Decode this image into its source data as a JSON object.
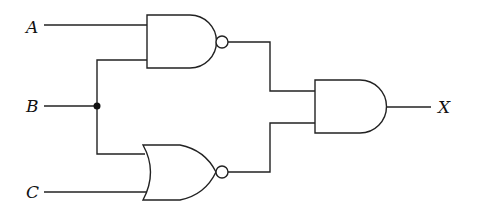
{
  "diagram": {
    "type": "logic-circuit",
    "inputs": [
      {
        "id": "A",
        "label": "A"
      },
      {
        "id": "B",
        "label": "B"
      },
      {
        "id": "C",
        "label": "C"
      }
    ],
    "output": {
      "id": "X",
      "label": "X"
    },
    "gates": [
      {
        "id": "g1",
        "type": "NAND",
        "inputs": [
          "A",
          "B"
        ]
      },
      {
        "id": "g2",
        "type": "NOR",
        "inputs": [
          "B",
          "C"
        ]
      },
      {
        "id": "g3",
        "type": "AND",
        "inputs": [
          "g1",
          "g2"
        ],
        "output": "X"
      }
    ],
    "junctions": [
      {
        "net": "B"
      }
    ]
  }
}
